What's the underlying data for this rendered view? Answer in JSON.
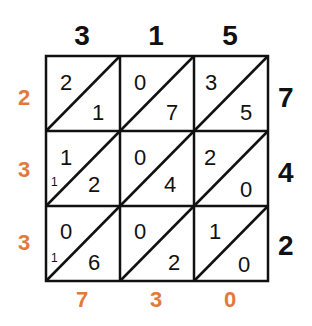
{
  "top_digits": [
    "3",
    "1",
    "5"
  ],
  "right_digits": [
    "7",
    "4",
    "2"
  ],
  "left_result": [
    "2",
    "3",
    "3"
  ],
  "bottom_result": [
    "7",
    "3",
    "0"
  ],
  "cells": [
    [
      {
        "tens": "2",
        "ones": "1"
      },
      {
        "tens": "0",
        "ones": "7"
      },
      {
        "tens": "3",
        "ones": "5"
      }
    ],
    [
      {
        "tens": "1",
        "ones": "2"
      },
      {
        "tens": "0",
        "ones": "4"
      },
      {
        "tens": "2",
        "ones": "0"
      }
    ],
    [
      {
        "tens": "0",
        "ones": "6"
      },
      {
        "tens": "0",
        "ones": "2"
      },
      {
        "tens": "1",
        "ones": "0"
      }
    ]
  ],
  "carries": [
    "1",
    "1"
  ],
  "colors": {
    "result": "#e07a3a",
    "digits": "#111111"
  }
}
